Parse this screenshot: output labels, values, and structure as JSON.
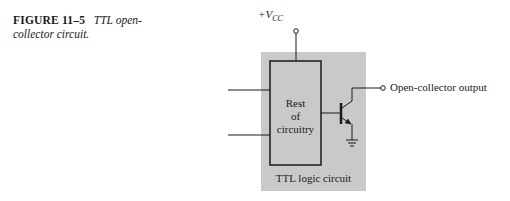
{
  "caption": {
    "figure_number": "FIGURE 11–5",
    "title_line1": "TTL open-",
    "title_line2": "collector circuit."
  },
  "diagram": {
    "supply_label_prefix": "+V",
    "supply_label_subscript": "CC",
    "inner_block_label": [
      "Rest",
      "of",
      "circuitry"
    ],
    "package_label": "TTL logic circuit",
    "output_label": "Open-collector output",
    "colors": {
      "package_fill": "#c9c9c9",
      "line": "#1a1a1a"
    }
  }
}
